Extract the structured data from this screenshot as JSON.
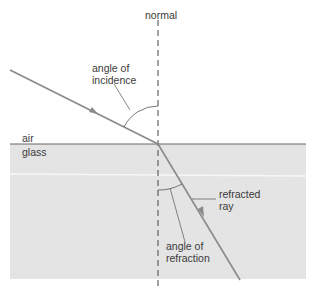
{
  "diagram": {
    "type": "refraction-of-light",
    "labels": {
      "normal": "normal",
      "angle_incidence_line1": "angle of",
      "angle_incidence_line2": "incidence",
      "air": "air",
      "glass": "glass",
      "refracted_line1": "refracted",
      "refracted_line2": "ray",
      "angle_refraction_line1": "angle of",
      "angle_refraction_line2": "refraction"
    },
    "colors": {
      "background": "#ffffff",
      "glass_fill": "#e4e4e4",
      "ray": "#8a8a8a",
      "line": "#555555",
      "text": "#3a3a3a"
    },
    "media": [
      {
        "name": "air",
        "position": "top"
      },
      {
        "name": "glass",
        "position": "bottom"
      }
    ],
    "rays": [
      {
        "name": "incident ray",
        "from": [
          10,
          70
        ],
        "to": [
          158,
          144
        ]
      },
      {
        "name": "refracted ray",
        "from": [
          158,
          144
        ],
        "to": [
          240,
          280
        ]
      }
    ],
    "normal_line": {
      "x": 158,
      "style": "dashed"
    }
  }
}
